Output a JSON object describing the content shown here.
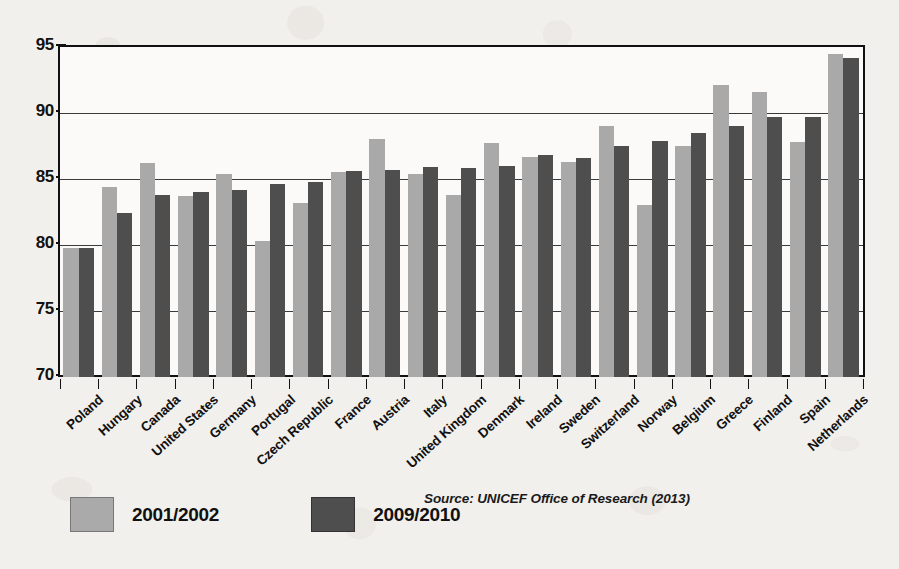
{
  "chart_data": {
    "type": "bar",
    "title": "",
    "subtitle": "",
    "xlabel": "",
    "ylabel": "",
    "ylim": [
      70,
      95
    ],
    "yticks": [
      70,
      75,
      80,
      85,
      90,
      95
    ],
    "grid": true,
    "legend_position": "bottom-left",
    "colors": {
      "series_2001_2002": "#a9a9a9",
      "series_2009_2010": "#4e4e4e",
      "axis": "#111111",
      "plot_background": "#fbfaf8",
      "page_background": "#f2f0ec"
    },
    "categories": [
      "Poland",
      "Hungary",
      "Canada",
      "United States",
      "Germany",
      "Portugal",
      "Czech Republic",
      "France",
      "Austria",
      "Italy",
      "United Kingdom",
      "Denmark",
      "Ireland",
      "Sweden",
      "Switzerland",
      "Norway",
      "Belgium",
      "Greece",
      "Finland",
      "Spain",
      "Netherlands"
    ],
    "series": [
      {
        "name": "2001/2002",
        "values": [
          79.8,
          84.4,
          86.2,
          83.7,
          85.4,
          80.3,
          83.2,
          85.5,
          88.0,
          85.4,
          83.8,
          87.7,
          86.7,
          86.3,
          89.0,
          83.0,
          87.5,
          92.1,
          91.6,
          87.8,
          94.5
        ]
      },
      {
        "name": "2009/2010",
        "values": [
          79.8,
          82.4,
          83.8,
          84.0,
          84.2,
          84.6,
          84.8,
          85.6,
          85.7,
          85.9,
          85.8,
          86.0,
          86.8,
          86.6,
          87.5,
          87.9,
          88.5,
          89.0,
          89.7,
          89.7,
          94.2
        ]
      }
    ],
    "annotations": {
      "source": "Source: UNICEF Office of Research (2013)"
    }
  },
  "legend": {
    "items": [
      {
        "label": "2001/2002",
        "swatch": "light-gray"
      },
      {
        "label": "2009/2010",
        "swatch": "dark-gray"
      }
    ]
  },
  "source": {
    "text": "Source: UNICEF Office of Research (2013)"
  }
}
